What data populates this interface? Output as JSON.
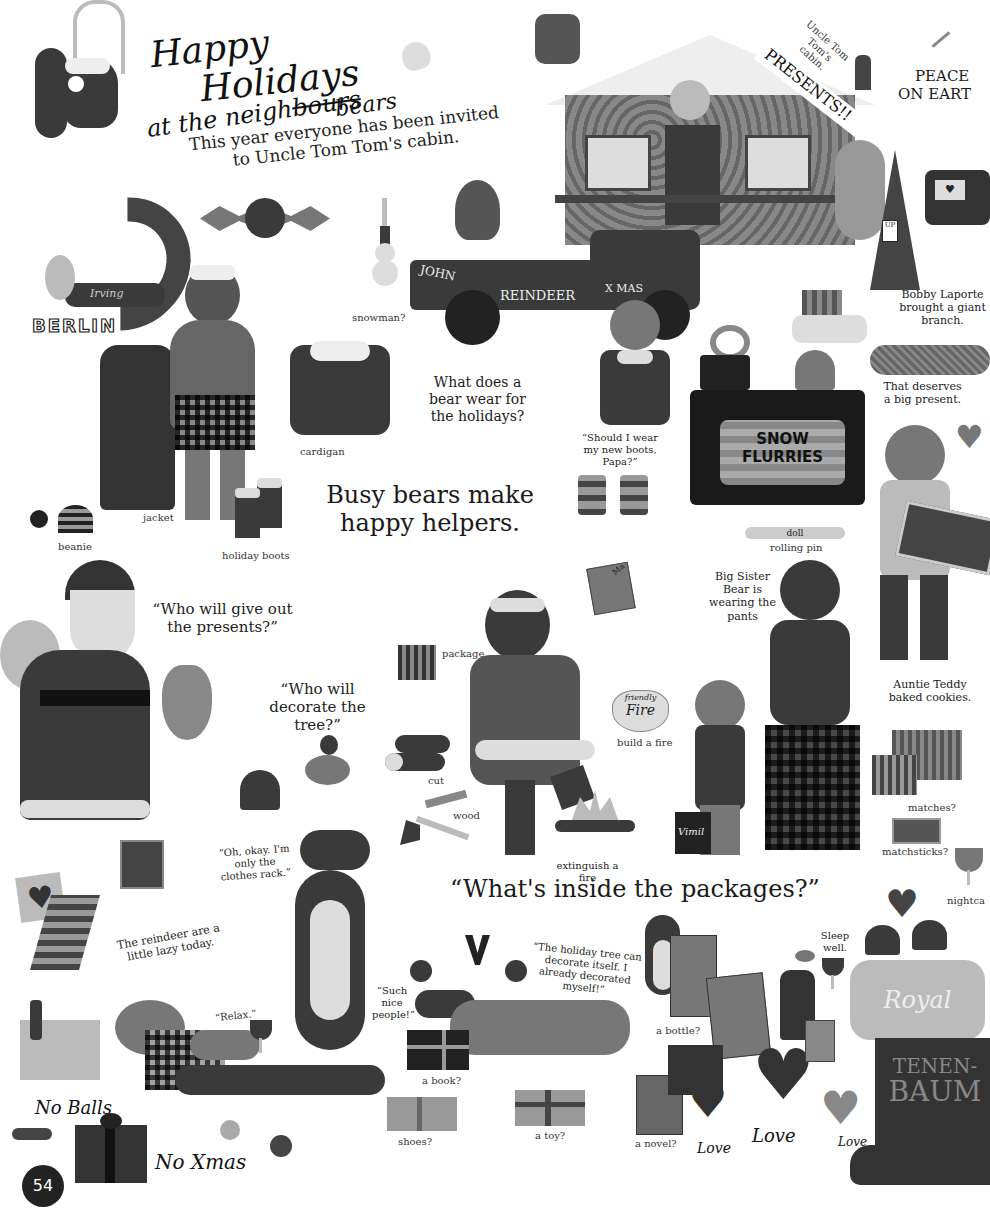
{
  "page": {
    "title_line1": "Happy",
    "title_line2": "Holidays",
    "title_line3": "at the neigh",
    "title_struck": "bours",
    "title_replacement": "bears",
    "intro": "This year everyone has been invited to Uncle Tom Tom's cabin.",
    "page_number": "54"
  },
  "top_right": {
    "cabin_sign": "Uncle Tom Tom's cabin.",
    "presents_banner": "PRESENTS!!",
    "peace_line1": "PEACE",
    "peace_line2": "ON EART"
  },
  "vehicles": {
    "truck_left": "JOHN",
    "truck_middle": "REINDEER",
    "truck_right": "X MAS"
  },
  "berlin": {
    "name_script": "Irving",
    "city": "BERLIN"
  },
  "labels": {
    "snowman": "snowman?",
    "cardigan": "cardigan",
    "jacket": "jacket",
    "beanie": "beanie",
    "holiday_boots": "holiday boots",
    "question_wear": "What does a bear wear for the holidays?",
    "should_wear_boots": "“Should I wear my new boots, Papa?”",
    "busy_bears": "Busy bears make happy helpers.",
    "bobby": "Bobby Laporte brought a giant branch.",
    "deserves": "That deserves a big present.",
    "snow_flurries_line1": "SNOW",
    "snow_flurries_line2": "FLURRIES",
    "doll": "doll",
    "rolling_pin": "rolling pin",
    "who_presents": "“Who will give out the presents?”",
    "who_decorate": "“Who will decorate the tree?”",
    "package": "package",
    "package_tag": "Ma",
    "big_sister": "Big Sister Bear is wearing the pants",
    "auntie": "Auntie Teddy baked cookies.",
    "friendly_fire_line1": "friendly",
    "friendly_fire_line2": "Fire",
    "build_fire": "build a fire",
    "cut": "cut",
    "wood": "wood",
    "extinguish": "extinguish a fire",
    "matches": "matches?",
    "matchsticks": "matchsticks?",
    "nightcap": "nightca",
    "clothes_rack": "“Oh, okay. I'm only the clothes rack.”",
    "whats_inside": "“What's inside the packages?”",
    "vimil_bag": "Vimil",
    "reindeer_lazy": "The reindeer are a little lazy today.",
    "relax": "“Relax.”",
    "such_nice": "“Such nice people!”",
    "holiday_tree": "“The holiday tree can decorate itself. I already decorated myself!”",
    "a_bottle": "a bottle?",
    "sleep_well": "Sleep well.",
    "a_book": "a book?",
    "shoes": "shoes?",
    "a_toy": "a toy?",
    "a_novel": "a novel?",
    "love1": "Love",
    "love2": "Love",
    "love3": "Love",
    "no_balls": "No Balls",
    "no_xmas": "No Xmas",
    "royal": "Royal",
    "tenenbaum_line1": "TENEN-",
    "tenenbaum_line2": "BAUM",
    "tree_tag": "UP"
  }
}
